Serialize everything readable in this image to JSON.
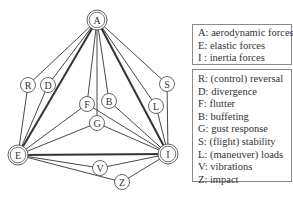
{
  "diagram": {
    "main_nodes": [
      {
        "id": "A",
        "label": "A",
        "x": 97,
        "y": 20
      },
      {
        "id": "E",
        "label": "E",
        "x": 18,
        "y": 155
      },
      {
        "id": "I",
        "label": "I",
        "x": 168,
        "y": 154
      }
    ],
    "phenomenon_nodes": [
      {
        "id": "R",
        "label": "R",
        "x": 28,
        "y": 85
      },
      {
        "id": "D",
        "label": "D",
        "x": 48,
        "y": 85
      },
      {
        "id": "F",
        "label": "F",
        "x": 87,
        "y": 104
      },
      {
        "id": "B",
        "label": "B",
        "x": 109,
        "y": 101
      },
      {
        "id": "G",
        "label": "G",
        "x": 97,
        "y": 123
      },
      {
        "id": "S",
        "label": "S",
        "x": 167,
        "y": 84
      },
      {
        "id": "L",
        "label": "L",
        "x": 156,
        "y": 106
      },
      {
        "id": "V",
        "label": "V",
        "x": 100,
        "y": 168
      },
      {
        "id": "Z",
        "label": "Z",
        "x": 122,
        "y": 182
      }
    ],
    "edges": [
      {
        "from": "A",
        "to": "E",
        "weight": "bold"
      },
      {
        "from": "A",
        "to": "I",
        "weight": "bold"
      },
      {
        "from": "E",
        "to": "I",
        "weight": "bold"
      },
      {
        "from": "A",
        "to": "R",
        "weight": "thin"
      },
      {
        "from": "R",
        "to": "E",
        "weight": "thin"
      },
      {
        "from": "A",
        "to": "D",
        "weight": "thin"
      },
      {
        "from": "D",
        "to": "E",
        "weight": "thin"
      },
      {
        "from": "A",
        "to": "F",
        "weight": "thin"
      },
      {
        "from": "F",
        "to": "E",
        "weight": "thin"
      },
      {
        "from": "F",
        "to": "I",
        "weight": "thin"
      },
      {
        "from": "A",
        "to": "B",
        "weight": "thin"
      },
      {
        "from": "B",
        "to": "I",
        "weight": "thin"
      },
      {
        "from": "A",
        "to": "G",
        "weight": "thin"
      },
      {
        "from": "G",
        "to": "E",
        "weight": "thin"
      },
      {
        "from": "G",
        "to": "I",
        "weight": "thin"
      },
      {
        "from": "A",
        "to": "S",
        "weight": "thin"
      },
      {
        "from": "S",
        "to": "I",
        "weight": "thin"
      },
      {
        "from": "A",
        "to": "L",
        "weight": "thin"
      },
      {
        "from": "L",
        "to": "I",
        "weight": "thin"
      },
      {
        "from": "E",
        "to": "V",
        "weight": "thin"
      },
      {
        "from": "V",
        "to": "I",
        "weight": "thin"
      },
      {
        "from": "E",
        "to": "Z",
        "weight": "thin"
      },
      {
        "from": "Z",
        "to": "I",
        "weight": "thin"
      }
    ]
  },
  "legend": {
    "forces": [
      "A: aerodynamic forces",
      "E: elastic forces",
      "I : inertia forces"
    ],
    "phenomena": [
      "R: (control) reversal",
      "D: divergence",
      "F: flutter",
      "B: buffeting",
      "G: gust response",
      "S: (flight) stability",
      "L: (maneuver) loads",
      "V: vibrations",
      "Z: impact"
    ]
  },
  "colors": {
    "line": "#333333",
    "node_stroke": "#555555",
    "box_border": "#8a8a8a"
  }
}
